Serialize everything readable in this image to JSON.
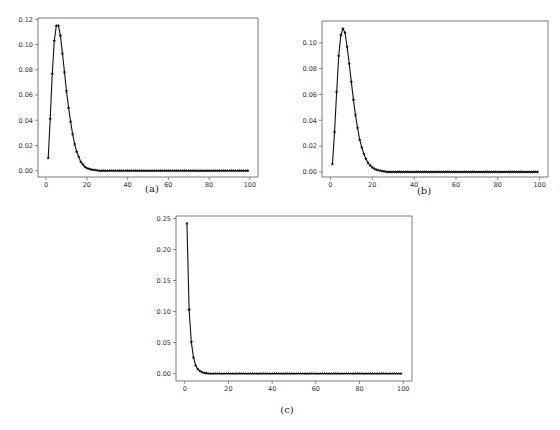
{
  "figure": {
    "background": "#ffffff",
    "line_color": "#111111",
    "marker": "star"
  },
  "chart_data": [
    {
      "id": "a",
      "type": "line",
      "caption": "(a)",
      "title": "",
      "xlabel": "",
      "ylabel": "",
      "xlim": [
        -4,
        104
      ],
      "ylim": [
        -0.005,
        0.121
      ],
      "xticks": [
        0,
        20,
        40,
        60,
        80,
        100
      ],
      "yticks": [
        0.0,
        0.02,
        0.04,
        0.06,
        0.08,
        0.1,
        0.12
      ],
      "ytick_labels": [
        "0.00",
        "0.02",
        "0.04",
        "0.06",
        "0.08",
        "0.10",
        "0.12"
      ],
      "grid": false,
      "legend": null,
      "x_start": 1,
      "x_end": 99,
      "values_head": [
        0.01,
        0.041,
        0.077,
        0.103,
        0.115,
        0.115,
        0.107,
        0.093,
        0.078,
        0.063,
        0.05,
        0.039,
        0.029,
        0.021,
        0.015,
        0.011,
        0.007,
        0.005,
        0.003,
        0.002,
        0.0015,
        0.001,
        0.0007,
        0.0005,
        0.0003
      ],
      "tail_value": 0.0
    },
    {
      "id": "b",
      "type": "line",
      "caption": "(b)",
      "title": "",
      "xlabel": "",
      "ylabel": "",
      "xlim": [
        -4,
        104
      ],
      "ylim": [
        -0.004,
        0.117
      ],
      "xticks": [
        0,
        20,
        40,
        60,
        80,
        100
      ],
      "yticks": [
        0.0,
        0.02,
        0.04,
        0.06,
        0.08,
        0.1
      ],
      "ytick_labels": [
        "0.00",
        "0.02",
        "0.04",
        "0.06",
        "0.08",
        "0.10"
      ],
      "grid": false,
      "legend": null,
      "x_start": 1,
      "x_end": 99,
      "values_head": [
        0.006,
        0.031,
        0.062,
        0.09,
        0.106,
        0.111,
        0.108,
        0.097,
        0.084,
        0.07,
        0.056,
        0.044,
        0.034,
        0.025,
        0.019,
        0.014,
        0.01,
        0.007,
        0.005,
        0.0035,
        0.0025,
        0.0017,
        0.0012,
        0.0008,
        0.0005,
        0.0003
      ],
      "tail_value": 0.0
    },
    {
      "id": "c",
      "type": "line",
      "caption": "(c)",
      "title": "",
      "xlabel": "",
      "ylabel": "",
      "xlim": [
        -4,
        104
      ],
      "ylim": [
        -0.012,
        0.254
      ],
      "xticks": [
        0,
        20,
        40,
        60,
        80,
        100
      ],
      "yticks": [
        0.0,
        0.05,
        0.1,
        0.15,
        0.2,
        0.25
      ],
      "ytick_labels": [
        "0.00",
        "0.05",
        "0.10",
        "0.15",
        "0.20",
        "0.25"
      ],
      "grid": false,
      "legend": null,
      "x_start": 1,
      "x_end": 99,
      "values_head": [
        0.242,
        0.103,
        0.051,
        0.026,
        0.013,
        0.007,
        0.004,
        0.002,
        0.001,
        0.0005
      ],
      "tail_value": 0.0
    }
  ]
}
